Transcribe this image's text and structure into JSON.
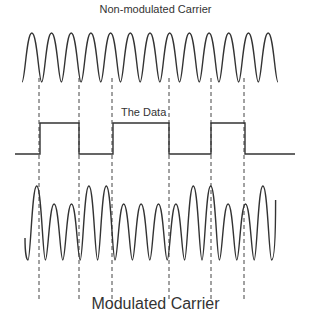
{
  "diagram": {
    "title": "Non-modulated Carrier",
    "data_label": "The Data",
    "bottom_label": "Modulated Carrier",
    "colors": {
      "stroke": "#333333",
      "background": "#ffffff"
    },
    "carrier": {
      "cycles": 13,
      "x_start": 22,
      "x_end": 278,
      "top": 33,
      "bottom": 82
    },
    "data_signal": {
      "bits": [
        0,
        1,
        0,
        1,
        0,
        1,
        0
      ],
      "transitions_x": [
        15,
        40,
        79,
        113,
        169,
        211,
        245,
        295
      ],
      "low_y": 154,
      "high_y": 123
    },
    "modulated": {
      "x_start": 25,
      "bottom": 260,
      "high_amp_top": 186,
      "low_amp_top": 204,
      "cycles": [
        {
          "amp": "high"
        },
        {
          "amp": "low"
        },
        {
          "amp": "low"
        },
        {
          "amp": "high"
        },
        {
          "amp": "high"
        },
        {
          "amp": "low"
        },
        {
          "amp": "low"
        },
        {
          "amp": "low"
        },
        {
          "amp": "low"
        },
        {
          "amp": "high"
        },
        {
          "amp": "high"
        },
        {
          "amp": "low"
        },
        {
          "amp": "low"
        },
        {
          "amp": "high"
        }
      ]
    },
    "dashed_lines_x": [
      39,
      79,
      112,
      169,
      211,
      244
    ],
    "dashed_y_range": [
      78,
      300
    ]
  }
}
